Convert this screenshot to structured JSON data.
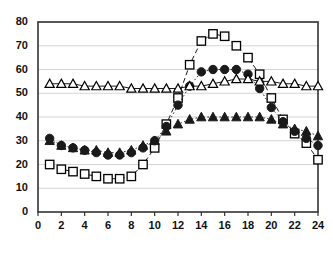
{
  "chart_data": {
    "type": "line",
    "title": "",
    "subtitle": "",
    "xlabel": "",
    "ylabel": "",
    "xlim": [
      0,
      24
    ],
    "ylim": [
      0,
      80
    ],
    "xticks": [
      0,
      2,
      4,
      6,
      8,
      10,
      12,
      14,
      16,
      18,
      20,
      22,
      24
    ],
    "yticks": [
      0,
      10,
      20,
      30,
      40,
      50,
      60,
      70,
      80
    ],
    "grid": "horizontal",
    "legend": "none",
    "x": [
      1,
      2,
      3,
      4,
      5,
      6,
      7,
      8,
      9,
      10,
      11,
      12,
      13,
      14,
      15,
      16,
      17,
      18,
      19,
      20,
      21,
      22,
      23,
      24
    ],
    "series": [
      {
        "name": "open-square",
        "marker": "open-square",
        "line": "dashed",
        "color": "#000000",
        "fill": "#ffffff",
        "values": [
          20,
          18,
          17,
          16,
          15,
          14,
          14,
          15,
          20,
          27,
          37,
          48,
          62,
          72,
          75,
          74,
          70,
          65,
          58,
          48,
          39,
          33,
          29,
          22
        ]
      },
      {
        "name": "filled-circle",
        "marker": "filled-circle",
        "line": "dotted",
        "color": "#1a1a1a",
        "fill": "#1a1a1a",
        "values": [
          31,
          28,
          27,
          26,
          25,
          24,
          24,
          25,
          27,
          30,
          36,
          45,
          53,
          59,
          60,
          60,
          60,
          58,
          52,
          44,
          38,
          34,
          31,
          28
        ]
      },
      {
        "name": "open-triangle",
        "marker": "open-triangle",
        "line": "solid",
        "color": "#000000",
        "fill": "#ffffff",
        "values": [
          54,
          54,
          54,
          53,
          53,
          53,
          53,
          52,
          52,
          52,
          52,
          52,
          53,
          53,
          54,
          55,
          56,
          56,
          55,
          55,
          54,
          54,
          53,
          53
        ]
      },
      {
        "name": "filled-triangle",
        "marker": "filled-triangle",
        "line": "dotted",
        "color": "#1a1a1a",
        "fill": "#1a1a1a",
        "values": [
          30,
          28,
          27,
          26,
          26,
          25,
          25,
          26,
          28,
          30,
          34,
          37,
          39,
          40,
          40,
          40,
          40,
          40,
          40,
          39,
          37,
          35,
          34,
          32
        ]
      }
    ]
  },
  "axes": {
    "y_tick_labels": [
      "80",
      "70",
      "60",
      "50",
      "40",
      "30",
      "20",
      "10",
      "0"
    ],
    "x_tick_labels": [
      "0",
      "2",
      "4",
      "6",
      "8",
      "10",
      "12",
      "14",
      "16",
      "18",
      "20",
      "22",
      "24"
    ]
  }
}
